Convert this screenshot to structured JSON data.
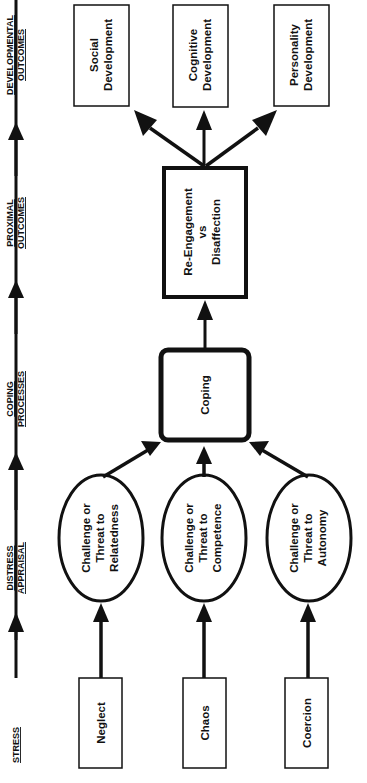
{
  "stages": [
    {
      "line1": "STRESS",
      "line2": ""
    },
    {
      "line1": "DISTRESS",
      "line2": "APPRAISAL"
    },
    {
      "line1": "COPING",
      "line2": "PROCESSES"
    },
    {
      "line1": "PROXIMAL",
      "line2": "OUTCOMES"
    },
    {
      "line1": "DEVELOPMENTAL",
      "line2": "OUTCOMES"
    }
  ],
  "stressors": [
    {
      "label": "Neglect"
    },
    {
      "label": "Chaos"
    },
    {
      "label": "Coercion"
    }
  ],
  "appraisals": [
    {
      "line1": "Challenge or",
      "line2": "Threat to",
      "line3": "Relatedness"
    },
    {
      "line1": "Challenge or",
      "line2": "Threat to",
      "line3": "Competence"
    },
    {
      "line1": "Challenge or",
      "line2": "Threat to",
      "line3": "Autonomy"
    }
  ],
  "coping": {
    "label": "Coping"
  },
  "proximal": {
    "line1": "Re-Engagement",
    "line2": "vs",
    "line3": "Disaffection"
  },
  "developmental": [
    {
      "line1": "Social",
      "line2": "Development"
    },
    {
      "line1": "Cognitive",
      "line2": "Development"
    },
    {
      "line1": "Personality",
      "line2": "Development"
    }
  ],
  "colors": {
    "stroke": "#111111",
    "background": "#ffffff"
  }
}
